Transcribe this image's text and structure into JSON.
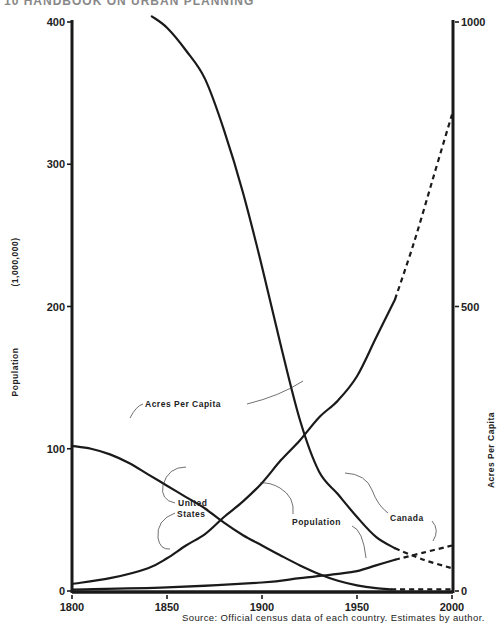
{
  "header": {
    "text": "10  HANDBOOK ON URBAN PLANNING"
  },
  "source_note": "Source:  Official census data of each country. Estimates by author.",
  "chart_data": {
    "type": "line",
    "title": "",
    "xlabel": "",
    "ylabel_left": "Population (1,000,000)",
    "ylabel_left_parts": [
      "Population",
      "(1,000,000)"
    ],
    "ylabel_right": "Acres Per Capita",
    "x_ticks": [
      1800,
      1850,
      1900,
      1950,
      2000
    ],
    "y_left_ticks": [
      0,
      100,
      200,
      300,
      400
    ],
    "y_right_ticks": [
      0,
      500,
      1000
    ],
    "xlim": [
      1800,
      2000
    ],
    "ylim_left": [
      0,
      400
    ],
    "ylim_right": [
      0,
      1000
    ],
    "grid": false,
    "series": [
      {
        "name": "United States Population",
        "axis": "left",
        "solid": {
          "x": [
            1800,
            1820,
            1840,
            1850,
            1860,
            1870,
            1880,
            1890,
            1900,
            1910,
            1920,
            1930,
            1940,
            1950,
            1960,
            1970
          ],
          "values": [
            5,
            9,
            16,
            23,
            32,
            40,
            52,
            63,
            76,
            92,
            106,
            122,
            134,
            151,
            178,
            205
          ]
        },
        "projected": {
          "x": [
            1970,
            1980,
            1990,
            2000
          ],
          "values": [
            205,
            245,
            290,
            335
          ]
        }
      },
      {
        "name": "United States Acres Per Capita",
        "axis": "right",
        "solid": {
          "x": [
            1842,
            1850,
            1860,
            1870,
            1880,
            1890,
            1900,
            1910,
            1920,
            1930,
            1940,
            1950,
            1960,
            1970
          ],
          "values": [
            1010,
            990,
            950,
            900,
            810,
            700,
            570,
            430,
            300,
            210,
            170,
            130,
            95,
            75
          ]
        },
        "projected": {
          "x": [
            1970,
            1985,
            2000
          ],
          "values": [
            75,
            55,
            40
          ]
        }
      },
      {
        "name": "Canada Acres Per Capita",
        "axis": "right",
        "solid": {
          "x": [
            1800,
            1810,
            1820,
            1830,
            1840,
            1850,
            1860,
            1870,
            1880,
            1890,
            1900,
            1910,
            1920,
            1930,
            1940,
            1950,
            1960,
            1968
          ],
          "values": [
            255,
            250,
            240,
            225,
            205,
            185,
            165,
            145,
            120,
            98,
            80,
            62,
            45,
            30,
            18,
            10,
            5,
            3
          ]
        },
        "projected": {
          "x": [
            1968,
            2000
          ],
          "values": [
            3,
            3
          ]
        }
      },
      {
        "name": "Canada Population",
        "axis": "left",
        "solid": {
          "x": [
            1800,
            1850,
            1900,
            1920,
            1940,
            1950,
            1960,
            1970
          ],
          "values": [
            1,
            2.5,
            6,
            9,
            12,
            14,
            18,
            22
          ]
        },
        "projected": {
          "x": [
            1970,
            1985,
            2000
          ],
          "values": [
            22,
            27,
            32
          ]
        }
      }
    ],
    "annotations": [
      {
        "text": "Acres  Per  Capita",
        "points_to": [
          "United States Acres Per Capita",
          "Canada Acres Per Capita"
        ]
      },
      {
        "text": "United",
        "line2": "States",
        "points_to": [
          "United States Acres Per Capita",
          "United States Population"
        ]
      },
      {
        "text": "Population",
        "points_to": [
          "United States Population",
          "Canada Population"
        ]
      },
      {
        "text": "Canada",
        "points_to": [
          "Canada Acres Per Capita",
          "Canada Population"
        ]
      }
    ]
  }
}
